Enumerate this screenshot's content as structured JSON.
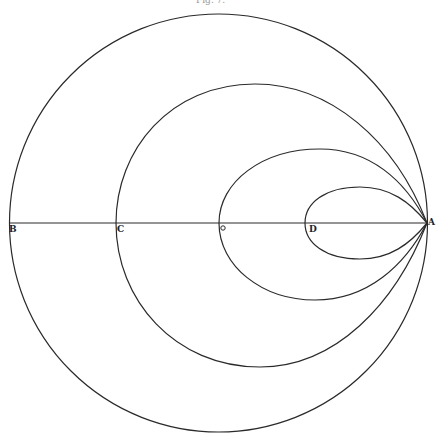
{
  "figure": {
    "caption": "Fig. 7.",
    "stroke_color": "#2a2a2a",
    "background": "#ffffff"
  },
  "points": [
    {
      "id": "B",
      "label": "B",
      "x": 10,
      "y": 223
    },
    {
      "id": "C",
      "label": "C",
      "x": 117,
      "y": 223
    },
    {
      "id": "O",
      "label": "O",
      "x": 220,
      "y": 223
    },
    {
      "id": "D",
      "label": "D",
      "x": 307,
      "y": 223
    },
    {
      "id": "A",
      "label": "A",
      "x": 427,
      "y": 223
    }
  ],
  "curves": [
    {
      "name": "outer-circle",
      "through": "B",
      "type": "circle"
    },
    {
      "name": "curve-through-C",
      "through": "C",
      "type": "loop"
    },
    {
      "name": "curve-through-O",
      "through": "O",
      "type": "loop"
    },
    {
      "name": "curve-through-D",
      "through": "D",
      "type": "loop"
    }
  ],
  "axis": {
    "name": "horizontal-diameter",
    "from": "B",
    "to": "A"
  }
}
